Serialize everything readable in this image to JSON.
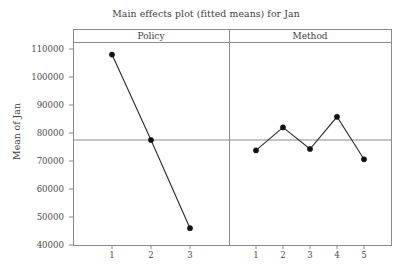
{
  "chart_data": {
    "type": "line",
    "title": "Main effects plot (fitted means) for Jan",
    "xlabel": "",
    "ylabel": "Mean of Jan",
    "ylim": [
      40000,
      110000
    ],
    "yticks": [
      40000,
      50000,
      60000,
      70000,
      80000,
      90000,
      100000,
      110000
    ],
    "ytick_labels": [
      "40000",
      "50000",
      "60000",
      "70000",
      "80000",
      "90000",
      "100000",
      "110000"
    ],
    "grid": false,
    "legend": "none",
    "reference_line": 77500,
    "panels": [
      {
        "name": "Policy",
        "categories": [
          "1",
          "2",
          "3"
        ],
        "values": [
          108000,
          77500,
          46000
        ]
      },
      {
        "name": "Method",
        "categories": [
          "1",
          "2",
          "3",
          "4",
          "5"
        ],
        "values": [
          73800,
          82000,
          74300,
          85800,
          70600
        ]
      }
    ],
    "series": [
      {
        "name": "Policy",
        "values": [
          108000,
          77500,
          46000
        ]
      },
      {
        "name": "Method",
        "values": [
          73800,
          82000,
          74300,
          85800,
          70600
        ]
      }
    ],
    "colors": {
      "line": "#2b2b2b",
      "marker": "#111111",
      "axis": "#8a8a8a",
      "reference_line": "#8a8a8a",
      "background": "#ffffff",
      "text": "#3d3d3d"
    }
  }
}
